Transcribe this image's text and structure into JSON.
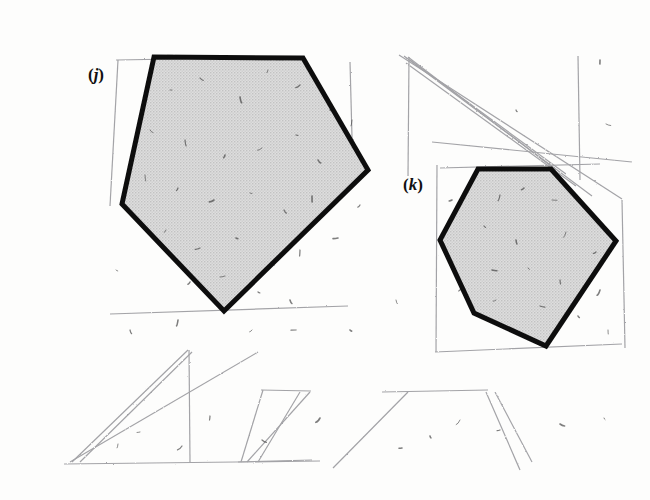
{
  "figure": {
    "kind": "scanned-textbook-geometry-figure",
    "background_color": "#fdfdfc",
    "ink_color": "#111111",
    "fill_color": "#d7d7d7",
    "pencil_color": "#8d8d92",
    "grid": {
      "name": "square-grid",
      "x": 52,
      "y": 25,
      "columns": 16,
      "rows": 12,
      "cell_width": 35.5,
      "cell_height": 36.4,
      "line_color": "#2b2b2b",
      "line_width": 1.5,
      "border_width": 2.2
    },
    "shapes": [
      {
        "id": "j",
        "label": "(j)",
        "label_open": "(",
        "label_letter": "j",
        "label_close": ")",
        "label_x": 96,
        "label_y": 80,
        "type": "pentagon",
        "sides": 5,
        "stroke_width": 5,
        "vertices": [
          [
            154,
            57
          ],
          [
            303,
            58
          ],
          [
            368,
            170
          ],
          [
            224,
            311
          ],
          [
            122,
            204
          ]
        ]
      },
      {
        "id": "k",
        "label": "(k)",
        "label_open": "(",
        "label_letter": "k",
        "label_close": ")",
        "label_x": 413,
        "label_y": 190,
        "type": "hexagon",
        "sides": 6,
        "stroke_width": 5,
        "vertices": [
          [
            478,
            169
          ],
          [
            551,
            169
          ],
          [
            616,
            241
          ],
          [
            546,
            346
          ],
          [
            474,
            313
          ],
          [
            440,
            240
          ]
        ]
      }
    ],
    "pencil_marks": [
      {
        "name": "erased-diagonal-1",
        "points": "408,57 556,170"
      },
      {
        "name": "erased-diagonal-2",
        "points": "410,60 566,174"
      },
      {
        "name": "erased-diagonal-3",
        "points": "404,56 592,196"
      },
      {
        "name": "erased-diagonal-4",
        "points": "406,63 576,186"
      },
      {
        "name": "erased-long-sweep",
        "points": "399,55 622,199"
      },
      {
        "name": "erased-shallow-sweep",
        "points": "432,142 632,162"
      },
      {
        "name": "erased-box-right-vert",
        "points": "578,56 580,180"
      },
      {
        "name": "erased-box-left-vert",
        "points": "409,57 408,176"
      },
      {
        "name": "pentagon-ghost-left",
        "points": "118,60 110,206"
      },
      {
        "name": "pentagon-ghost-top",
        "points": "116,60 300,57"
      },
      {
        "name": "pentagon-ghost-box-right",
        "points": "350,62 353,175"
      },
      {
        "name": "pentagon-ghost-bottom",
        "points": "110,314 348,306"
      },
      {
        "name": "hex-ghost-left",
        "points": "437,165 436,352"
      },
      {
        "name": "hex-ghost-top",
        "points": "440,168 600,164"
      },
      {
        "name": "hex-ghost-bottom",
        "points": "435,352 622,344"
      },
      {
        "name": "hex-ghost-right",
        "points": "622,200 625,348"
      },
      {
        "name": "sketch-tri-1",
        "points": "72,462 188,350"
      },
      {
        "name": "sketch-tri-2",
        "points": "80,462 192,352"
      },
      {
        "name": "sketch-tri-3",
        "points": "70,462 258,352"
      },
      {
        "name": "sketch-tri-vert",
        "points": "189,350 190,462"
      },
      {
        "name": "sketch-par-1",
        "points": "241,462 263,390"
      },
      {
        "name": "sketch-par-2",
        "points": "247,462 310,392"
      },
      {
        "name": "sketch-par-3",
        "points": "258,462 300,392"
      },
      {
        "name": "sketch-par-top",
        "points": "261,390 311,391"
      },
      {
        "name": "sketch-par-bottom",
        "points": "238,462 312,460"
      },
      {
        "name": "sketch-long-right",
        "points": "333,468 408,392"
      },
      {
        "name": "sketch-right-fan-1",
        "points": "486,392 520,470"
      },
      {
        "name": "sketch-right-fan-2",
        "points": "495,392 532,462"
      },
      {
        "name": "sketch-right-rail",
        "points": "382,392 488,390"
      },
      {
        "name": "baseline-smudge",
        "points": "64,464 320,461"
      }
    ],
    "speckles": [
      [
        170,
        90
      ],
      [
        200,
        78
      ],
      [
        240,
        97
      ],
      [
        268,
        70
      ],
      [
        300,
        85
      ],
      [
        330,
        110
      ],
      [
        150,
        130
      ],
      [
        185,
        140
      ],
      [
        225,
        155
      ],
      [
        262,
        148
      ],
      [
        296,
        135
      ],
      [
        318,
        160
      ],
      [
        145,
        175
      ],
      [
        178,
        188
      ],
      [
        214,
        200
      ],
      [
        250,
        193
      ],
      [
        284,
        210
      ],
      [
        312,
        196
      ],
      [
        166,
        230
      ],
      [
        200,
        248
      ],
      [
        236,
        238
      ],
      [
        272,
        262
      ],
      [
        300,
        250
      ],
      [
        190,
        282
      ],
      [
        225,
        276
      ],
      [
        258,
        292
      ],
      [
        290,
        300
      ],
      [
        352,
        120
      ],
      [
        360,
        205
      ],
      [
        338,
        238
      ],
      [
        116,
        270
      ],
      [
        130,
        330
      ],
      [
        178,
        320
      ],
      [
        252,
        330
      ],
      [
        296,
        330
      ],
      [
        350,
        330
      ],
      [
        396,
        300
      ],
      [
        500,
        195
      ],
      [
        524,
        188
      ],
      [
        552,
        200
      ],
      [
        484,
        226
      ],
      [
        516,
        240
      ],
      [
        566,
        232
      ],
      [
        596,
        252
      ],
      [
        492,
        270
      ],
      [
        528,
        268
      ],
      [
        560,
        280
      ],
      [
        600,
        290
      ],
      [
        496,
        300
      ],
      [
        540,
        306
      ],
      [
        578,
        316
      ],
      [
        608,
        330
      ],
      [
        462,
        286
      ],
      [
        452,
        200
      ],
      [
        606,
        124
      ],
      [
        516,
        110
      ],
      [
        600,
        60
      ],
      [
        460,
        420
      ],
      [
        500,
        430
      ],
      [
        560,
        424
      ],
      [
        604,
        418
      ],
      [
        210,
        416
      ],
      [
        320,
        418
      ],
      [
        140,
        432
      ],
      [
        262,
        440
      ],
      [
        430,
        436
      ],
      [
        118,
        444
      ],
      [
        182,
        446
      ],
      [
        402,
        448
      ]
    ]
  }
}
